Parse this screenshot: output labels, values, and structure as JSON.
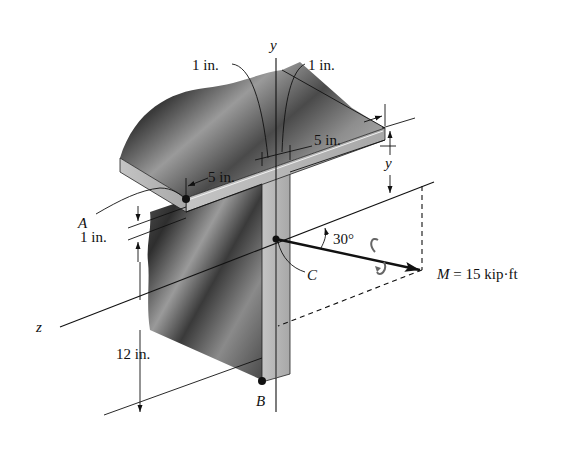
{
  "figure": {
    "axes": {
      "y_label": "y",
      "z_label": "z"
    },
    "points": {
      "A": "A",
      "B": "B",
      "C": "C"
    },
    "dimensions": {
      "flange_thickness": "1 in.",
      "web_thickness": "1 in.",
      "flange_half_width_right": "5 in.",
      "flange_half_width_left": "5 in.",
      "flange_thickness_vertical": "1 in.",
      "web_height": "12 in.",
      "centroid_distance": "y"
    },
    "moment": {
      "label": "M = 15 kip·ft",
      "symbol": "M",
      "value": "15",
      "unit": "kip·ft",
      "angle": "30°"
    },
    "colors": {
      "ink": "#111111",
      "shade_dark": "#3a3a3a",
      "shade_light": "#bdbdbd",
      "edge_face": "#b8b8b8",
      "background": "#ffffff"
    }
  }
}
